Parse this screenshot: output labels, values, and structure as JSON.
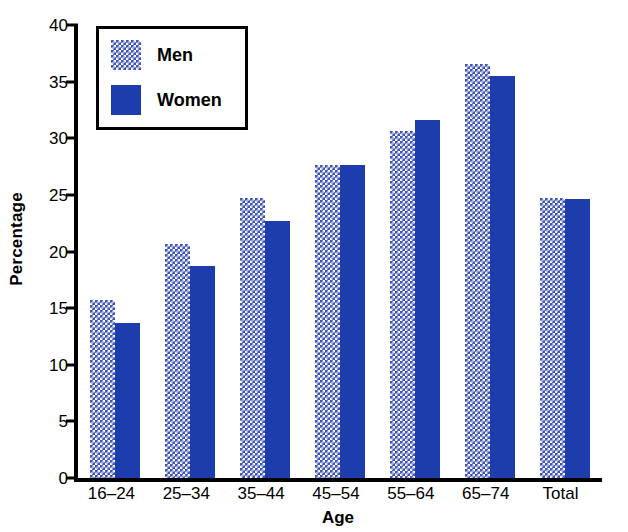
{
  "chart_data": {
    "type": "bar",
    "title": "",
    "xlabel": "Age",
    "ylabel": "Percentage",
    "categories": [
      "16–24",
      "25–34",
      "35–44",
      "45–54",
      "55–64",
      "65–74",
      "Total"
    ],
    "series": [
      {
        "name": "Men",
        "values": [
          15.7,
          20.7,
          24.7,
          27.6,
          30.6,
          36.6,
          24.7
        ]
      },
      {
        "name": "Women",
        "values": [
          13.7,
          18.7,
          22.7,
          27.6,
          31.6,
          35.5,
          24.6
        ]
      }
    ],
    "ylim": [
      0,
      40
    ],
    "yticks": [
      0,
      5,
      10,
      15,
      20,
      25,
      30,
      35,
      40
    ],
    "ytick_labels": [
      "0",
      "5",
      "10",
      "15",
      "20",
      "25",
      "30",
      "35",
      "40"
    ],
    "grid": false,
    "legend_position": "upper-left",
    "colors": {
      "men": "#4055b8",
      "women": "#1c3dab",
      "axis": "#000000",
      "background": "#ffffff"
    }
  },
  "legend": {
    "entries": [
      {
        "label": "Men",
        "swatch": "men-dotted-swatch"
      },
      {
        "label": "Women",
        "swatch": "women-solid-swatch"
      }
    ]
  }
}
